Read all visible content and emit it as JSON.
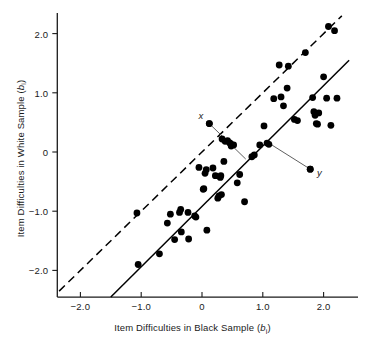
{
  "chart_data": {
    "type": "scatter",
    "title": "",
    "xlabel": "Item Difficulties in Black Sample (bᵢ)",
    "ylabel": "Item Difficulties in White Sample (bᵢ)",
    "xlabel_main": "Item Difficulties in Black Sample (",
    "xlabel_sym": "b",
    "xlabel_sub": "i",
    "xlabel_tail": ")",
    "ylabel_main": "Item Difficulties in White Sample (",
    "ylabel_sym": "b",
    "ylabel_sub": "i",
    "ylabel_tail": ")",
    "xlim": [
      -2.38,
      2.45
    ],
    "ylim": [
      -2.45,
      2.35
    ],
    "xticks": [
      -2.0,
      -1.0,
      0,
      1.0,
      2.0
    ],
    "xtick_labels": [
      "−2.0",
      "−1.0",
      "0",
      "1.0",
      "2.0"
    ],
    "yticks": [
      -2.0,
      -1.0,
      0,
      1.0,
      2.0
    ],
    "ytick_labels": [
      "−2.0",
      "−1.0",
      "0",
      "1.0",
      "2.0"
    ],
    "grid": false,
    "legend": "none",
    "marker_color": "#000000",
    "marker_size": 3.4,
    "lines": [
      {
        "name": "identity-line",
        "style": "dashed",
        "color": "#000000",
        "x0": -2.35,
        "y0": -2.35,
        "x1": 2.3,
        "y1": 2.3
      },
      {
        "name": "regression-line",
        "style": "solid",
        "color": "#000000",
        "x0": -1.5,
        "y0": -2.45,
        "x1": 2.42,
        "y1": 1.55
      }
    ],
    "annotations": [
      {
        "label": "x",
        "label_x": -0.02,
        "label_y": 0.62,
        "dot_x": 0.12,
        "dot_y": 0.48,
        "leader_x": 0.72,
        "leader_y": -0.12
      },
      {
        "label": "y",
        "label_x": 1.93,
        "label_y": -0.33,
        "dot_x": 1.78,
        "dot_y": -0.29,
        "leader_x": 1.1,
        "leader_y": 0.15
      }
    ],
    "points": [
      [
        -1.07,
        -1.03
      ],
      [
        -1.05,
        -1.9
      ],
      [
        -0.7,
        -1.72
      ],
      [
        -0.57,
        -1.2
      ],
      [
        -0.52,
        -1.05
      ],
      [
        -0.45,
        -1.48
      ],
      [
        -0.37,
        -1.02
      ],
      [
        -0.35,
        -0.97
      ],
      [
        -0.34,
        -1.35
      ],
      [
        -0.23,
        -1.02
      ],
      [
        -0.22,
        -1.47
      ],
      [
        -0.12,
        -1.08
      ],
      [
        -0.1,
        -1.1
      ],
      [
        -0.05,
        -0.26
      ],
      [
        0.02,
        -0.63
      ],
      [
        0.03,
        -0.62
      ],
      [
        0.05,
        -0.36
      ],
      [
        0.07,
        -0.3
      ],
      [
        0.08,
        -1.32
      ],
      [
        0.12,
        0.48
      ],
      [
        0.18,
        -0.27
      ],
      [
        0.22,
        -0.4
      ],
      [
        0.26,
        -0.78
      ],
      [
        0.28,
        -0.74
      ],
      [
        0.3,
        -0.43
      ],
      [
        0.31,
        -0.4
      ],
      [
        0.32,
        -0.72
      ],
      [
        0.33,
        0.22
      ],
      [
        0.36,
        -0.16
      ],
      [
        0.38,
        0.18
      ],
      [
        0.42,
        0.19
      ],
      [
        0.45,
        0.16
      ],
      [
        0.47,
        0.14
      ],
      [
        0.48,
        0.1
      ],
      [
        0.52,
        0.12
      ],
      [
        0.58,
        -0.52
      ],
      [
        0.62,
        -0.38
      ],
      [
        0.7,
        -0.84
      ],
      [
        0.82,
        -0.08
      ],
      [
        0.86,
        -0.05
      ],
      [
        0.95,
        0.12
      ],
      [
        1.02,
        0.44
      ],
      [
        1.07,
        0.15
      ],
      [
        1.1,
        0.13
      ],
      [
        1.18,
        0.9
      ],
      [
        1.27,
        1.47
      ],
      [
        1.3,
        0.93
      ],
      [
        1.34,
        0.78
      ],
      [
        1.4,
        1.08
      ],
      [
        1.42,
        1.45
      ],
      [
        1.52,
        0.55
      ],
      [
        1.57,
        0.53
      ],
      [
        1.7,
        1.68
      ],
      [
        1.78,
        -0.29
      ],
      [
        1.82,
        0.92
      ],
      [
        1.84,
        0.68
      ],
      [
        1.86,
        0.62
      ],
      [
        1.88,
        0.48
      ],
      [
        1.9,
        0.47
      ],
      [
        1.92,
        0.66
      ],
      [
        2.0,
        1.27
      ],
      [
        2.05,
        0.91
      ],
      [
        2.08,
        2.12
      ],
      [
        2.12,
        0.45
      ],
      [
        2.18,
        2.05
      ],
      [
        2.22,
        0.91
      ]
    ]
  }
}
